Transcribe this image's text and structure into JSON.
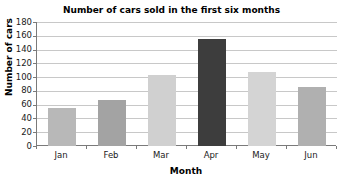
{
  "chart_data": {
    "type": "bar",
    "title": "Number of cars sold in the first six months",
    "xlabel": "Month",
    "ylabel": "Number of cars",
    "categories": [
      "Jan",
      "Feb",
      "Mar",
      "Apr",
      "May",
      "Jun"
    ],
    "values": [
      55,
      67,
      103,
      155,
      107,
      85
    ],
    "ylim": [
      0,
      180
    ],
    "ytick_step": 20,
    "yticks": [
      0,
      20,
      40,
      60,
      80,
      100,
      120,
      140,
      160,
      180
    ],
    "ytick_labels": [
      "0",
      "20",
      "40",
      "60",
      "80",
      "100",
      "120",
      "140",
      "160",
      "180"
    ],
    "grid": "horizontal",
    "legend": "none",
    "bar_colors": [
      "#b8b8b8",
      "#a3a3a3",
      "#d0d0d0",
      "#3d3d3d",
      "#d4d4d4",
      "#b0b0b0"
    ],
    "gridline_color": "#c8c8c8",
    "axis_color": "#7a7a7a",
    "highlight_category": "Apr"
  }
}
